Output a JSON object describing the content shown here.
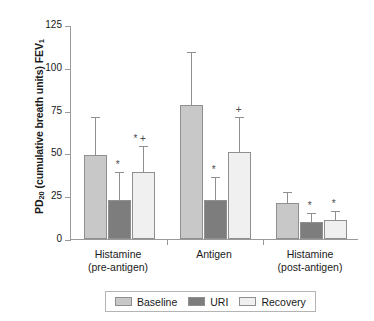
{
  "chart_data": {
    "type": "bar",
    "title": "",
    "xlabel": "",
    "ylabel": "PD20 (cumulative breath units) FEV1",
    "ylabel_parts": {
      "prefix": "PD",
      "sub1": "20",
      "middle": " (cumulative breath units) FEV",
      "sub2": "1"
    },
    "ylim": [
      0,
      125
    ],
    "yticks": [
      0,
      25,
      50,
      75,
      100,
      125
    ],
    "ytick_labels": [
      "0",
      "25",
      "50",
      "75",
      "100",
      "125"
    ],
    "grid": false,
    "legend_position": "bottom-center",
    "categories": [
      "Histamine\n(pre-antigen)",
      "Antigen",
      "Histamine\n(post-antigen)"
    ],
    "category_lines": [
      [
        "Histamine",
        "(pre-antigen)"
      ],
      [
        "Antigen",
        ""
      ],
      [
        "Histamine",
        "(post-antigen)"
      ]
    ],
    "series": [
      {
        "name": "Baseline",
        "color": "#c8c8c8",
        "values": [
          49,
          78,
          21
        ],
        "error_upper": [
          72,
          110,
          28
        ],
        "markers": [
          "",
          "",
          ""
        ]
      },
      {
        "name": "URI",
        "color": "#7d7d7d",
        "values": [
          23,
          23,
          10
        ],
        "error_upper": [
          40,
          37,
          16
        ],
        "markers": [
          "*",
          "*",
          "*"
        ]
      },
      {
        "name": "Recovery",
        "color": "#f0f0f0",
        "values": [
          39,
          51,
          11
        ],
        "error_upper": [
          55,
          72,
          17
        ],
        "markers": [
          "* +",
          "+",
          "*"
        ]
      }
    ]
  },
  "legend": {
    "items": [
      {
        "label": "Baseline",
        "color": "#c8c8c8"
      },
      {
        "label": "URI",
        "color": "#7d7d7d"
      },
      {
        "label": "Recovery",
        "color": "#f0f0f0"
      }
    ]
  },
  "axis": {
    "line_color": "#9a9a9a",
    "bar_edge_color": "#8f8f8f"
  }
}
